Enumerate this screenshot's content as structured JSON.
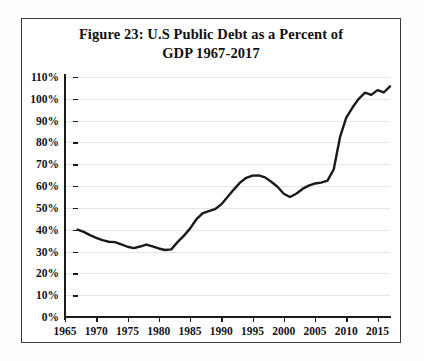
{
  "figure": {
    "title_line1": "Figure 23: U.S Public Debt as a Percent of",
    "title_line2": "GDP 1967-2017"
  },
  "chart_data": {
    "type": "line",
    "title": "Figure 23: U.S Public Debt as a Percent of GDP 1967-2017",
    "xlabel": "",
    "ylabel": "",
    "xlim": [
      1965,
      2017
    ],
    "ylim": [
      0,
      110
    ],
    "grid": true,
    "legend": false,
    "y_tick_labels": [
      "110%",
      "100%",
      "90%",
      "80%",
      "70%",
      "60%",
      "50%",
      "40%",
      "30%",
      "20%",
      "10%",
      "0%"
    ],
    "y_tick_values": [
      110,
      100,
      90,
      80,
      70,
      60,
      50,
      40,
      30,
      20,
      10,
      0
    ],
    "x_tick_labels": [
      "1965",
      "1970",
      "1975",
      "1980",
      "1985",
      "1990",
      "1995",
      "2000",
      "2005",
      "2010",
      "2015"
    ],
    "x_tick_values": [
      1965,
      1970,
      1975,
      1980,
      1985,
      1990,
      1995,
      2000,
      2005,
      2010,
      2015
    ],
    "line_color": "#1a1a1a",
    "series": [
      {
        "name": "U.S Public Debt as a Percent of GDP",
        "x": [
          1967,
          1968,
          1969,
          1970,
          1971,
          1972,
          1973,
          1974,
          1975,
          1976,
          1977,
          1978,
          1979,
          1980,
          1981,
          1982,
          1983,
          1984,
          1985,
          1986,
          1987,
          1988,
          1989,
          1990,
          1991,
          1992,
          1993,
          1994,
          1995,
          1996,
          1997,
          1998,
          1999,
          2000,
          2001,
          2002,
          2003,
          2004,
          2005,
          2006,
          2007,
          2008,
          2009,
          2010,
          2011,
          2012,
          2013,
          2014,
          2015,
          2016,
          2017
        ],
        "values": [
          40.0,
          39.0,
          37.5,
          36.3,
          35.2,
          34.5,
          34.3,
          33.3,
          32.2,
          31.6,
          32.3,
          33.2,
          32.4,
          31.4,
          30.7,
          31.0,
          34.3,
          37.2,
          40.5,
          44.7,
          47.5,
          48.5,
          49.4,
          51.6,
          55.0,
          58.4,
          61.6,
          63.8,
          64.8,
          64.9,
          64.0,
          62.0,
          59.7,
          56.5,
          55.0,
          56.5,
          58.7,
          60.2,
          61.2,
          61.6,
          62.5,
          67.7,
          82.4,
          91.4,
          96.0,
          100.0,
          102.8,
          101.8,
          104.0,
          102.9,
          105.7
        ]
      }
    ]
  }
}
